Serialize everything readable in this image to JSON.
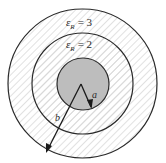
{
  "figure": {
    "colors": {
      "background": "#ffffff",
      "line": "#2a2a2a",
      "hatch": "#cfcfcf",
      "inner_conductor": "#bdbdbd"
    },
    "regions": [
      {
        "name": "outer-dielectric",
        "symbol": "ε",
        "subscript": "R",
        "equals": "= 3",
        "value": 3
      },
      {
        "name": "inner-dielectric",
        "symbol": "ε",
        "subscript": "R",
        "equals": "= 2",
        "value": 2
      }
    ],
    "radii_labels": {
      "inner": "a",
      "outer": "b"
    }
  }
}
